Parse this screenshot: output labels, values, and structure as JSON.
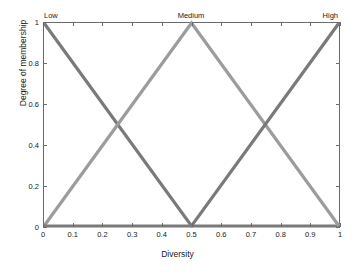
{
  "chart_data": {
    "type": "line",
    "title": "",
    "xlabel": "Diversity",
    "ylabel": "Degree of membership",
    "xlim": [
      0,
      1
    ],
    "ylim": [
      0,
      1
    ],
    "grid": false,
    "legend_position": "none",
    "x_ticks": [
      "0",
      "0.1",
      "0.2",
      "0.3",
      "0.4",
      "0.5",
      "0.6",
      "0.7",
      "0.8",
      "0.9",
      "1"
    ],
    "x_tick_values": [
      0,
      0.1,
      0.2,
      0.3,
      0.4,
      0.5,
      0.6,
      0.7,
      0.8,
      0.9,
      1
    ],
    "y_ticks": [
      "0",
      "0.2",
      "0.4",
      "0.6",
      "0.8",
      "1"
    ],
    "y_tick_values": [
      0,
      0.2,
      0.4,
      0.6,
      0.8,
      1
    ],
    "annotations": [
      {
        "text": "Low",
        "x": 0.0,
        "y": 1.0,
        "position": "top-left"
      },
      {
        "text": "Medium",
        "x": 0.5,
        "y": 1.0,
        "position": "top-center"
      },
      {
        "text": "High",
        "x": 1.0,
        "y": 1.0,
        "position": "top-right"
      }
    ],
    "series": [
      {
        "name": "Low",
        "color": "#7a7a7a",
        "x": [
          0,
          0.5,
          1
        ],
        "values": [
          1,
          0,
          0
        ]
      },
      {
        "name": "Medium",
        "color": "#9c9c9c",
        "x": [
          0,
          0.5,
          1
        ],
        "values": [
          0,
          1,
          0
        ]
      },
      {
        "name": "High",
        "color": "#7a7a7a",
        "x": [
          0,
          0.5,
          1
        ],
        "values": [
          0,
          0,
          1
        ]
      }
    ]
  },
  "axes": {
    "x_title": "Diversity",
    "y_title": "Degree of membership",
    "frame_color": "#6b6b6b"
  },
  "labels": {
    "low": "Low",
    "medium": "Medium",
    "high": "High"
  }
}
